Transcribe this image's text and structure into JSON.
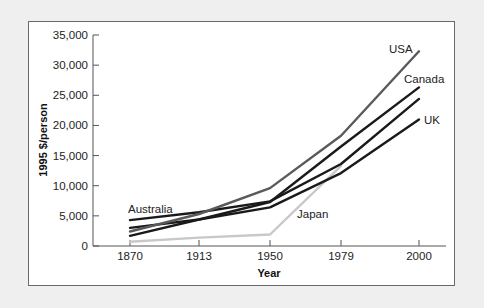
{
  "chart_data": {
    "type": "line",
    "title": "",
    "xlabel": "Year",
    "ylabel": "1995 $/person",
    "x": [
      "1870",
      "1913",
      "1950",
      "1979",
      "2000"
    ],
    "ylim": [
      0,
      35000
    ],
    "yticks": [
      0,
      5000,
      10000,
      15000,
      20000,
      25000,
      30000,
      35000
    ],
    "ytick_labels": [
      "0",
      "5,000",
      "10,000",
      "15,000",
      "20,000",
      "25,000",
      "30,000",
      "35,000"
    ],
    "grid": false,
    "legend": "inline labels",
    "series": [
      {
        "name": "USA",
        "color": "#5a5a5a",
        "values": [
          2400,
          5300,
          9600,
          18300,
          32300
        ]
      },
      {
        "name": "Canada",
        "color": "#1a1a1a",
        "values": [
          1700,
          4400,
          7300,
          16500,
          26300
        ]
      },
      {
        "name": "Australia",
        "color": "#1a1a1a",
        "values": [
          4300,
          5600,
          7400,
          13600,
          24400
        ]
      },
      {
        "name": "UK",
        "color": "#1a1a1a",
        "values": [
          3000,
          4400,
          6400,
          12100,
          21000
        ]
      },
      {
        "name": "Japan",
        "color": "#c8c8c8",
        "values": [
          700,
          1400,
          1900,
          13300,
          null
        ]
      }
    ]
  },
  "labels": {
    "usa": "USA",
    "canada": "Canada",
    "uk": "UK",
    "australia": "Australia",
    "japan": "Japan",
    "xlabel": "Year",
    "ylabel": "1995 $/person"
  }
}
